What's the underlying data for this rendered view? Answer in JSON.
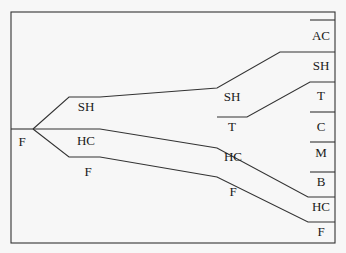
{
  "diagram": {
    "type": "branching-flow",
    "colors": {
      "line": "#333333",
      "background": "#f7f7f7",
      "text": "#1a1a1a"
    },
    "root": {
      "label": "F"
    },
    "stage1": [
      {
        "label": "SH"
      },
      {
        "label": "HC"
      },
      {
        "label": "F"
      }
    ],
    "stage2": [
      {
        "label": "SH"
      },
      {
        "label": "T"
      },
      {
        "label": "HC"
      },
      {
        "label": "F"
      }
    ],
    "outputs": [
      {
        "label": "AC"
      },
      {
        "label": "SH"
      },
      {
        "label": "T"
      },
      {
        "label": "C"
      },
      {
        "label": "M"
      },
      {
        "label": "B"
      },
      {
        "label": "HC"
      },
      {
        "label": "F"
      }
    ]
  }
}
